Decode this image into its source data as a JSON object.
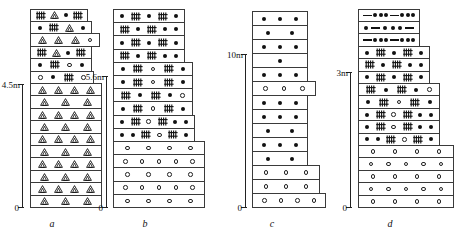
{
  "figure": {
    "title": "",
    "columns": [
      {
        "id": "a",
        "caption": "a",
        "scale_top_label": "4.5m",
        "scale_bottom_label": "0",
        "bands": [
          {
            "w": 58,
            "symbols": [
              "hatch",
              "tri",
              "dotf",
              "hatch"
            ]
          },
          {
            "w": 62,
            "symbols": [
              "dotf",
              "hatch",
              "tri",
              "dotf"
            ]
          },
          {
            "w": 70,
            "symbols": [
              "tri",
              "tri",
              "tri",
              "doto"
            ]
          },
          {
            "w": 62,
            "symbols": [
              "hatch",
              "tri",
              "dotf",
              "hatch"
            ]
          },
          {
            "w": 62,
            "symbols": [
              "dotf",
              "hatch",
              "doto",
              "dotf"
            ]
          },
          {
            "w": 64,
            "symbols": [
              "doto",
              "dotf",
              "hatch",
              "doto"
            ]
          },
          {
            "w": 72,
            "symbols": [
              "tri",
              "tri",
              "tri",
              "tri"
            ]
          },
          {
            "w": 72,
            "symbols": [
              "tri",
              "tri",
              "tri"
            ]
          },
          {
            "w": 72,
            "symbols": [
              "tri",
              "tri",
              "tri",
              "tri"
            ]
          },
          {
            "w": 72,
            "symbols": [
              "tri",
              "tri",
              "tri"
            ]
          },
          {
            "w": 72,
            "symbols": [
              "tri",
              "tri",
              "tri",
              "tri"
            ]
          },
          {
            "w": 72,
            "symbols": [
              "tri",
              "tri",
              "tri"
            ]
          },
          {
            "w": 72,
            "symbols": [
              "tri",
              "tri",
              "tri",
              "tri"
            ]
          },
          {
            "w": 72,
            "symbols": [
              "tri",
              "tri",
              "tri"
            ]
          },
          {
            "w": 72,
            "symbols": [
              "tri",
              "tri",
              "tri",
              "tri"
            ]
          },
          {
            "w": 72,
            "symbols": [
              "tri",
              "tri",
              "tri"
            ]
          }
        ]
      },
      {
        "id": "b",
        "caption": "b",
        "scale_top_label": "5.6m",
        "scale_bottom_label": "0",
        "bands": [
          {
            "w": 72,
            "symbols": [
              "dotf",
              "hatch",
              "dotf",
              "hatch",
              "dotf"
            ]
          },
          {
            "w": 72,
            "symbols": [
              "hatch",
              "dotf",
              "hatch",
              "dotf",
              "dotf"
            ]
          },
          {
            "w": 72,
            "symbols": [
              "dotf",
              "hatch",
              "dotf",
              "hatch",
              "dotf"
            ]
          },
          {
            "w": 72,
            "symbols": [
              "hatch",
              "dotf",
              "hatch",
              "dotf",
              "dotf"
            ]
          },
          {
            "w": 80,
            "symbols": [
              "dotf",
              "hatch",
              "doto",
              "hatch",
              "dotf"
            ]
          },
          {
            "w": 80,
            "symbols": [
              "dotf",
              "hatch",
              "doto",
              "hatch",
              "dotf"
            ]
          },
          {
            "w": 80,
            "symbols": [
              "hatch",
              "dotf",
              "hatch",
              "dotf",
              "doto"
            ]
          },
          {
            "w": 80,
            "symbols": [
              "dotf",
              "hatch",
              "doto",
              "hatch",
              "dotf"
            ]
          },
          {
            "w": 82,
            "symbols": [
              "dotf",
              "hatch",
              "doto",
              "hatch",
              "dotf",
              "dotf"
            ]
          },
          {
            "w": 82,
            "symbols": [
              "dotf",
              "dotf",
              "hatch",
              "doto",
              "hatch",
              "dotf"
            ]
          },
          {
            "w": 92,
            "symbols": [
              "doto",
              "doto",
              "doto",
              "doto"
            ]
          },
          {
            "w": 92,
            "symbols": [
              "doto",
              "doto",
              "doto",
              "doto",
              "doto"
            ]
          },
          {
            "w": 92,
            "symbols": [
              "doto",
              "doto",
              "doto",
              "doto"
            ]
          },
          {
            "w": 92,
            "symbols": [
              "doto",
              "doto",
              "doto",
              "doto",
              "doto"
            ]
          },
          {
            "w": 92,
            "symbols": [
              "doto",
              "doto",
              "doto",
              "doto"
            ]
          }
        ]
      },
      {
        "id": "c",
        "caption": "c",
        "scale_top_label": "10m",
        "scale_bottom_label": "0",
        "bands": [
          {
            "w": 56,
            "symbols": [
              "dotf",
              "dotf",
              "dotf"
            ]
          },
          {
            "w": 56,
            "symbols": [
              "dotf",
              "dotf"
            ]
          },
          {
            "w": 56,
            "symbols": [
              "dotf",
              "dotf",
              "dotf"
            ]
          },
          {
            "w": 56,
            "symbols": [
              "dotf"
            ]
          },
          {
            "w": 56,
            "symbols": [
              "dotf",
              "dotf",
              "dotf"
            ]
          },
          {
            "w": 64,
            "symbols": [
              "doto",
              "doto",
              "doto"
            ]
          },
          {
            "w": 56,
            "symbols": [
              "dotf",
              "dotf",
              "dotf"
            ]
          },
          {
            "w": 56,
            "symbols": [
              "dotf",
              "dotf",
              "dotf"
            ]
          },
          {
            "w": 56,
            "symbols": [
              "dotf",
              "dotf"
            ]
          },
          {
            "w": 56,
            "symbols": [
              "dotf",
              "dotf",
              "dotf"
            ]
          },
          {
            "w": 56,
            "symbols": [
              "dotf",
              "dotf"
            ]
          },
          {
            "w": 68,
            "symbols": [
              "doto",
              "doto",
              "doto"
            ]
          },
          {
            "w": 68,
            "symbols": [
              "doto",
              "doto",
              "doto"
            ]
          },
          {
            "w": 74,
            "symbols": [
              "doto",
              "doto",
              "doto",
              "doto"
            ]
          }
        ]
      },
      {
        "id": "d",
        "caption": "d",
        "scale_top_label": "3m",
        "scale_bottom_label": "0",
        "bands": [
          {
            "w": 62,
            "symbols": [
              "dash",
              "dotf",
              "dotf",
              "dotf",
              "dash",
              "dotf",
              "dotf",
              "dotf"
            ]
          },
          {
            "w": 62,
            "symbols": [
              "dotf",
              "dash",
              "dotf",
              "dotf",
              "dotf",
              "dash"
            ]
          },
          {
            "w": 62,
            "symbols": [
              "dash",
              "dotf",
              "dotf",
              "dotf",
              "dash",
              "dotf",
              "dotf",
              "dotf"
            ]
          },
          {
            "w": 72,
            "symbols": [
              "dotf",
              "hatch",
              "dotf",
              "hatch",
              "dotf"
            ]
          },
          {
            "w": 72,
            "symbols": [
              "hatch",
              "dotf",
              "hatch",
              "dotf",
              "dotf"
            ]
          },
          {
            "w": 72,
            "symbols": [
              "dotf",
              "hatch",
              "dotf",
              "hatch",
              "dotf"
            ]
          },
          {
            "w": 82,
            "symbols": [
              "hatch",
              "dotf",
              "hatch",
              "dotf",
              "doto"
            ]
          },
          {
            "w": 82,
            "symbols": [
              "dotf",
              "hatch",
              "doto",
              "hatch",
              "dotf"
            ]
          },
          {
            "w": 82,
            "symbols": [
              "dotf",
              "hatch",
              "doto",
              "hatch",
              "dotf",
              "dotf"
            ]
          },
          {
            "w": 82,
            "symbols": [
              "dotf",
              "hatch",
              "doto",
              "hatch",
              "dotf",
              "dotf"
            ]
          },
          {
            "w": 82,
            "symbols": [
              "dotf",
              "dotf",
              "hatch",
              "doto",
              "hatch",
              "dotf"
            ]
          },
          {
            "w": 96,
            "symbols": [
              "doto",
              "doto",
              "doto",
              "doto"
            ]
          },
          {
            "w": 96,
            "symbols": [
              "doto",
              "doto",
              "doto",
              "doto",
              "doto"
            ]
          },
          {
            "w": 96,
            "symbols": [
              "doto",
              "doto",
              "doto",
              "doto"
            ]
          },
          {
            "w": 96,
            "symbols": [
              "doto",
              "doto",
              "doto",
              "doto",
              "doto"
            ]
          },
          {
            "w": 96,
            "symbols": [
              "doto",
              "doto",
              "doto",
              "doto"
            ]
          }
        ]
      }
    ],
    "legend_symbol_names": {
      "tri": "triangle-clast-symbol",
      "hatch": "hatched-bar-symbol",
      "dotf": "filled-circle-symbol",
      "doto": "open-circle-symbol",
      "dash": "dash-symbol"
    }
  }
}
